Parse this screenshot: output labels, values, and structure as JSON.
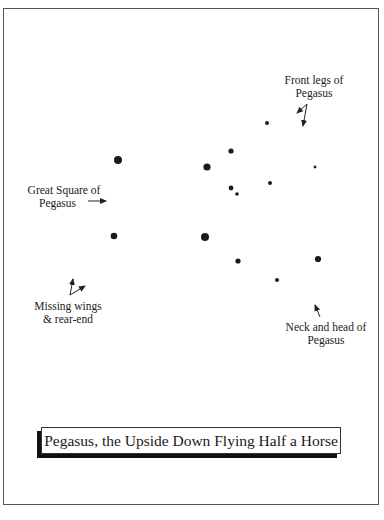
{
  "title": "Pegasus, the Upside Down Flying Half a Horse",
  "labels": {
    "front_legs": [
      "Front legs of",
      "Pegasus"
    ],
    "great_square": [
      "Great Square of",
      "Pegasus"
    ],
    "missing_wings": [
      "Missing wings",
      "& rear-end"
    ],
    "neck_head": [
      "Neck and head of",
      "Pegasus"
    ]
  },
  "colors": {
    "star": "#1a1a1a",
    "frame": "#555555",
    "shadow": "#111111"
  },
  "stars": [
    {
      "x": 118,
      "y": 160,
      "r": 4.0
    },
    {
      "x": 207,
      "y": 167,
      "r": 3.6
    },
    {
      "x": 231,
      "y": 151,
      "r": 2.6
    },
    {
      "x": 267,
      "y": 123,
      "r": 2.0
    },
    {
      "x": 231,
      "y": 188,
      "r": 2.4
    },
    {
      "x": 237,
      "y": 194,
      "r": 1.8
    },
    {
      "x": 270,
      "y": 183,
      "r": 2.0
    },
    {
      "x": 315,
      "y": 167,
      "r": 1.4
    },
    {
      "x": 114,
      "y": 236,
      "r": 3.3
    },
    {
      "x": 205,
      "y": 237,
      "r": 4.0
    },
    {
      "x": 238,
      "y": 261,
      "r": 2.6
    },
    {
      "x": 318,
      "y": 259,
      "r": 3.1
    },
    {
      "x": 277,
      "y": 280,
      "r": 2.0
    }
  ]
}
